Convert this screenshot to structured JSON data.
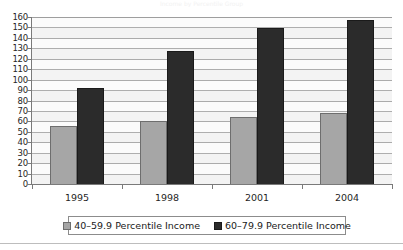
{
  "figure": {
    "ghost_title": "Income by Percentile Group",
    "background_color": "#ffffff"
  },
  "chart_data": {
    "type": "bar",
    "title": "",
    "xlabel": "",
    "ylabel": "",
    "categories": [
      "1995",
      "1998",
      "2001",
      "2004"
    ],
    "series": [
      {
        "name": "40–59.9 Percentile Income",
        "color": "#a6a6a6",
        "values": [
          57,
          61,
          65,
          69
        ]
      },
      {
        "name": "60–79.9 Percentile Income",
        "color": "#2b2b2b",
        "values": [
          93,
          128,
          150,
          158
        ]
      }
    ],
    "ylim": [
      0,
      160
    ],
    "ytick_step": 10,
    "yticks": [
      160,
      150,
      140,
      130,
      120,
      110,
      100,
      90,
      80,
      70,
      60,
      50,
      40,
      30,
      20,
      10,
      0
    ],
    "grid": true,
    "legend_position": "bottom"
  },
  "legend": {
    "entries": [
      {
        "label": "40–59.9 Percentile Income",
        "color": "#a6a6a6"
      },
      {
        "label": "60–79.9 Percentile Income",
        "color": "#2b2b2b"
      }
    ]
  }
}
